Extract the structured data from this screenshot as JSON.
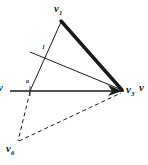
{
  "figure": {
    "background_color": "#ffffff",
    "stroke_color": "#1a1a1a",
    "width": 148,
    "height": 165
  },
  "labels": {
    "apex": {
      "base": "v",
      "sub": "1"
    },
    "right_vertex": {
      "base": "v",
      "sub": "3"
    },
    "bottom_vertex": {
      "base": "v",
      "sub": "6"
    },
    "left_edge_partial": {
      "base": "v",
      "sub": ""
    },
    "right_edge_partial": {
      "base": "v",
      "sub": ""
    },
    "mark_a": "a",
    "mark_b": "1"
  },
  "geometry": {
    "points": {
      "apex": {
        "x": 61,
        "y": 20
      },
      "right_vertex": {
        "x": 122,
        "y": 91
      },
      "bottom_vertex": {
        "x": 18,
        "y": 143
      },
      "axis_mark": {
        "x": 30,
        "y": 90
      },
      "chord_left": {
        "x": 30,
        "y": 52
      },
      "axis_left": {
        "x": 10,
        "y": 91
      },
      "axis_right": {
        "x": 124,
        "y": 91
      }
    },
    "edges": [
      {
        "name": "thick-edge-apex-to-right",
        "from": "apex",
        "to": "right_vertex",
        "style": "solid",
        "weight": 3.4
      },
      {
        "name": "thin-edge-apex-to-axis",
        "from": "apex",
        "to": "axis_mark",
        "style": "solid",
        "weight": 1.0
      },
      {
        "name": "thin-chord-to-right",
        "from": "chord_left",
        "to": "right_vertex",
        "style": "solid",
        "weight": 1.0
      },
      {
        "name": "horizontal-axis",
        "from": "axis_left",
        "to": "axis_right",
        "style": "solid",
        "weight": 1.4
      },
      {
        "name": "dashed-axis-to-bottom",
        "from": "axis_mark",
        "to": "bottom_vertex",
        "style": "dashed",
        "weight": 1.0
      },
      {
        "name": "dashed-bottom-to-right",
        "from": "bottom_vertex",
        "to": "right_vertex",
        "style": "dashed",
        "weight": 1.0
      }
    ],
    "arrowheads": [
      {
        "name": "arrow-at-right-vertex-from-axis",
        "at": "right_vertex"
      }
    ]
  }
}
